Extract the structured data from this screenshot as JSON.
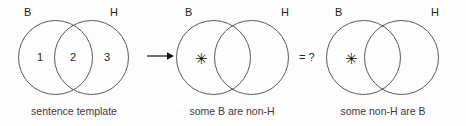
{
  "figure": {
    "background_color": "#fdfdfd",
    "stroke_color": "#58595b",
    "text_color": "#231f20",
    "caption_color": "#3b3b3d",
    "panels": [
      {
        "id": "sentence-template",
        "caption": "sentence template",
        "left_set_label": "B",
        "right_set_label": "H",
        "regions": [
          {
            "key": "left-only",
            "label": "1"
          },
          {
            "key": "intersection",
            "label": "2"
          },
          {
            "key": "right-only",
            "label": "3"
          }
        ],
        "marker": ""
      },
      {
        "id": "some-b-are-non-h",
        "caption": "some B are non-H",
        "left_set_label": "B",
        "right_set_label": "H",
        "regions": [],
        "marker": "✳",
        "marker_region": "left-only"
      },
      {
        "id": "some-non-h-are-b",
        "caption": "some non-H are B",
        "left_set_label": "B",
        "right_set_label": "H",
        "regions": [],
        "marker": "✳",
        "marker_region": "left-only"
      }
    ],
    "connectors": [
      {
        "id": "arrow",
        "symbol": "→",
        "between": "sentence-template,some-b-are-non-h"
      },
      {
        "id": "equals-question",
        "symbol": "= ?",
        "between": "some-b-are-non-h,some-non-h-are-b"
      }
    ]
  }
}
